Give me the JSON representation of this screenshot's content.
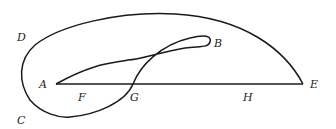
{
  "diagram": {
    "type": "geometric-curve-figure",
    "stroke_color": "#1a1a1a",
    "background": "#ffffff",
    "labels": {
      "A": "A",
      "B": "B",
      "C": "C",
      "D": "D",
      "E": "E",
      "F": "F",
      "G": "G",
      "H": "H"
    },
    "segments": [
      {
        "name": "AE",
        "from": "A",
        "to": "E"
      }
    ]
  }
}
